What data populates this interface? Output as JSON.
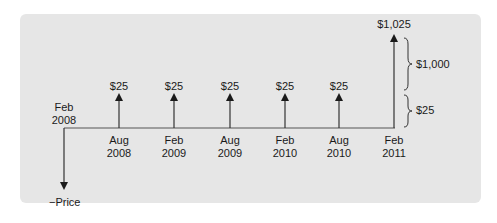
{
  "diagram": {
    "title": "",
    "start_label": {
      "month": "Feb",
      "year": "2008"
    },
    "outflow_label": "−Price",
    "cash_flows": [
      {
        "month": "Aug",
        "year": "2008",
        "amount": "$25"
      },
      {
        "month": "Feb",
        "year": "2009",
        "amount": "$25"
      },
      {
        "month": "Aug",
        "year": "2009",
        "amount": "$25"
      },
      {
        "month": "Feb",
        "year": "2010",
        "amount": "$25"
      },
      {
        "month": "Aug",
        "year": "2010",
        "amount": "$25"
      },
      {
        "month": "Feb",
        "year": "2011",
        "amount": "$1,025"
      }
    ],
    "braces": [
      {
        "label": "$1,000"
      },
      {
        "label": "$25"
      }
    ],
    "colors": {
      "panel": "#e6e6e6",
      "line": "#333333",
      "text": "#1a1a1a"
    }
  }
}
